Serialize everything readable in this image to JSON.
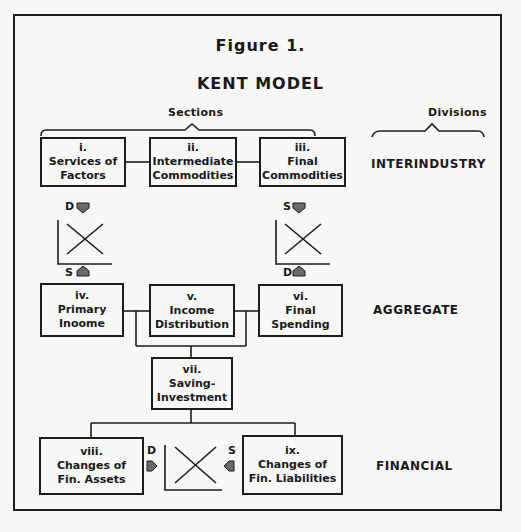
{
  "figure": {
    "label": "Figure 1.",
    "title": "KENT MODEL"
  },
  "headings": {
    "sections": "Sections",
    "divisions": "Divisions"
  },
  "divisions": [
    {
      "name": "INTERINDUSTRY"
    },
    {
      "name": "AGGREGATE"
    },
    {
      "name": "FINANCIAL"
    }
  ],
  "boxes": [
    {
      "numeral": "i.",
      "line1": "Services of",
      "line2": "Factors"
    },
    {
      "numeral": "ii.",
      "line1": "Intermediate",
      "line2": "Commodities"
    },
    {
      "numeral": "iii.",
      "line1": "Final",
      "line2": "Commodities"
    },
    {
      "numeral": "iv.",
      "line1": "Primary",
      "line2": "Inoome"
    },
    {
      "numeral": "v.",
      "line1": "Income",
      "line2": "Distribution"
    },
    {
      "numeral": "vi.",
      "line1": "Final",
      "line2": "Spending"
    },
    {
      "numeral": "vii.",
      "line1": "Saving-",
      "line2": "Investment"
    },
    {
      "numeral": "viii.",
      "line1": "Changes of",
      "line2": "Fin. Assets"
    },
    {
      "numeral": "ix.",
      "line1": "Changes of",
      "line2": "Fin. Liabilities"
    }
  ],
  "markets": {
    "factor": {
      "top": "D",
      "bottom": "S"
    },
    "commodity": {
      "top": "S",
      "bottom": "D"
    },
    "financial": {
      "left": "D",
      "right": "S"
    }
  },
  "colors": {
    "ink": "#1c1c1c",
    "paper": "#f7f7f5",
    "marker": "#6a6a6a"
  }
}
